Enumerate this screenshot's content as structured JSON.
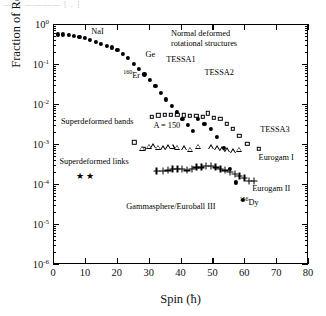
{
  "figure": {
    "top_partial_text": "——  ————  [ , ]"
  },
  "chart_data": {
    "type": "scatter",
    "title": "",
    "xlabel": "Spin (ħ)",
    "ylabel": "Fraction of Reaction Channel",
    "xlim": [
      0,
      80
    ],
    "ylim": [
      1e-06,
      1
    ],
    "yscale": "log",
    "xticks": [
      0,
      10,
      20,
      30,
      40,
      50,
      60,
      70,
      80
    ],
    "ytick_labels": [
      "10⁰",
      "10⁻¹",
      "10⁻²",
      "10⁻³",
      "10⁻⁴",
      "10⁻⁵",
      "10⁻⁶"
    ],
    "ytick_exponents": [
      0,
      -1,
      -2,
      -3,
      -4,
      -5,
      -6
    ],
    "grid": false,
    "legend": "none",
    "series": [
      {
        "name": "Normal deformed rotational structures",
        "marker": "filled-circle",
        "x": [
          1.5,
          3.2,
          4.9,
          6.6,
          8.3,
          10.0,
          11.7,
          13.4,
          15.1,
          16.8,
          18.5,
          20.2,
          21.9,
          23.6,
          25.3,
          27.0,
          28.7,
          30.4,
          32.1,
          33.8,
          35.5,
          37.2,
          38.9,
          40.6,
          42.3,
          44.0
        ],
        "y": [
          0.55,
          0.55,
          0.53,
          0.5,
          0.47,
          0.44,
          0.4,
          0.36,
          0.32,
          0.29,
          0.26,
          0.22,
          0.18,
          0.14,
          0.1,
          0.075,
          0.055,
          0.04,
          0.028,
          0.019,
          0.013,
          0.009,
          0.0062,
          0.0043,
          0.003,
          0.0021
        ]
      },
      {
        "name": "Superdeformed bands A = 150 (TESSA3, open squares)",
        "marker": "open-square",
        "x": [
          25.5,
          28.5,
          31.0,
          33.0,
          35.0,
          37.0,
          39.0,
          41.0,
          43.0,
          45.0,
          47.0,
          48.5,
          50.5,
          52.5,
          54.5,
          56.5,
          58.5,
          61.0,
          64.5
        ],
        "y": [
          0.0011,
          0.00075,
          0.0048,
          0.0052,
          0.0053,
          0.0053,
          0.0053,
          0.0052,
          0.0051,
          0.005,
          0.0048,
          0.0058,
          0.0045,
          0.0042,
          0.0032,
          0.0024,
          0.0016,
          0.001,
          0.00075
        ]
      },
      {
        "name": "Superdeformed bands (Eurogam I, open triangles)",
        "marker": "open-triangle",
        "x": [
          28.0,
          30.0,
          31.5,
          33.0,
          34.5,
          36.0,
          37.5,
          39.0,
          41.0,
          43.0,
          45.5,
          49.5,
          51.5,
          53.0,
          54.5,
          56.5,
          58.5
        ],
        "y": [
          0.00075,
          0.00085,
          0.00088,
          0.0008,
          0.00078,
          0.00082,
          0.00085,
          0.0008,
          0.00078,
          0.00072,
          0.00085,
          0.00082,
          0.00078,
          0.00074,
          0.0007,
          0.00066,
          0.00072
        ]
      },
      {
        "name": "Superdeformed bands (Eurogam II, plus signs)",
        "marker": "plus",
        "x": [
          32.5,
          34.5,
          36.0,
          37.5,
          39.0,
          40.5,
          42.0,
          43.5,
          45.0,
          46.5,
          48.0,
          49.5,
          51.0,
          52.5,
          54.0,
          55.5,
          57.0,
          58.5,
          60.0,
          61.5,
          63.0
        ],
        "y": [
          0.00021,
          0.00021,
          0.00022,
          0.00024,
          0.00024,
          0.00024,
          0.00022,
          0.00024,
          0.00026,
          0.00026,
          0.00028,
          0.00028,
          0.00026,
          0.00024,
          0.00022,
          0.0002,
          0.00018,
          0.00016,
          0.00014,
          0.00012,
          0.00012
        ]
      },
      {
        "name": "Superdeformed bands (descending, filled circles)",
        "marker": "filled-circle",
        "x": [
          45.5,
          47.5,
          49.5,
          51.5,
          53.5,
          55.5,
          57.5,
          59.5
        ],
        "y": [
          0.0042,
          0.0032,
          0.0024,
          0.0015,
          0.0008,
          0.00024,
          0.00011,
          4e-05
        ]
      },
      {
        "name": "Superdeformed links (stars)",
        "marker": "star",
        "x": [
          8.5,
          11.5
        ],
        "y": [
          0.00016,
          0.00016
        ]
      }
    ],
    "annotations": [
      {
        "id": "nai",
        "text": "NaI",
        "x": 12.0,
        "y": 0.62
      },
      {
        "id": "ge",
        "text": "Ge",
        "x": 29.0,
        "y": 0.17
      },
      {
        "id": "er160",
        "text": "160Er",
        "x": 22.0,
        "y": 0.055,
        "html": "<sup>160</sup>Er"
      },
      {
        "id": "normal",
        "text": "Normal deformed rotational structures",
        "x": 37.0,
        "y": 0.55
      },
      {
        "id": "tessa1",
        "text": "TESSA1",
        "x": 35.5,
        "y": 0.125
      },
      {
        "id": "tessa2",
        "text": "TESSA2",
        "x": 47.5,
        "y": 0.06
      },
      {
        "id": "sdbands",
        "text": "Superdeformed bands",
        "x": 2.5,
        "y": 0.0035
      },
      {
        "id": "a150",
        "text": "A = 150",
        "x": 31.5,
        "y": 0.0028
      },
      {
        "id": "tessa3",
        "text": "TESSA3",
        "x": 65.0,
        "y": 0.0022
      },
      {
        "id": "eurogam1",
        "text": "Eurogam I",
        "x": 64.5,
        "y": 0.00045
      },
      {
        "id": "sdlinks",
        "text": "Superdeformed links",
        "x": 2.0,
        "y": 0.00035
      },
      {
        "id": "eurogam2",
        "text": "Eurogam II",
        "x": 62.5,
        "y": 7.5e-05
      },
      {
        "id": "gammasphere",
        "text": "Gammasphere/Euroball III",
        "x": 23.0,
        "y": 2.6e-05
      },
      {
        "id": "dy156",
        "text": "156Dy",
        "x": 58.5,
        "y": 3.8e-05,
        "html": "<sup>156</sup>Dy"
      }
    ]
  }
}
